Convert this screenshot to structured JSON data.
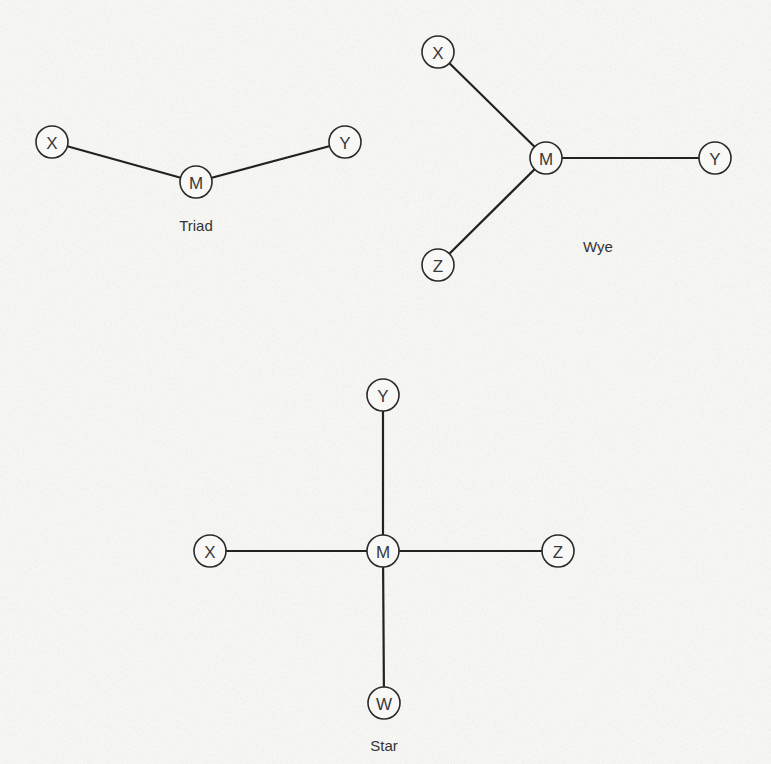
{
  "figure": {
    "node_radius": 16,
    "colors": {
      "background": "#f6f6f3",
      "stroke": "#222222",
      "text": "#333333"
    },
    "diagrams": [
      {
        "id": "triad",
        "caption": "Triad",
        "caption_pos": [
          196,
          225
        ],
        "nodes": [
          {
            "id": "X",
            "label": "X",
            "pos": [
              52,
              142
            ]
          },
          {
            "id": "M",
            "label": "M",
            "pos": [
              196,
              182
            ]
          },
          {
            "id": "Y",
            "label": "Y",
            "pos": [
              345,
              142
            ]
          }
        ],
        "edges": [
          [
            "X",
            "M"
          ],
          [
            "M",
            "Y"
          ]
        ]
      },
      {
        "id": "wye",
        "caption": "Wye",
        "caption_pos": [
          598,
          246
        ],
        "nodes": [
          {
            "id": "X",
            "label": "X",
            "pos": [
              438,
              52
            ]
          },
          {
            "id": "M",
            "label": "M",
            "pos": [
              546,
              158
            ]
          },
          {
            "id": "Y",
            "label": "Y",
            "pos": [
              715,
              158
            ]
          },
          {
            "id": "Z",
            "label": "Z",
            "pos": [
              438,
              265
            ]
          }
        ],
        "edges": [
          [
            "X",
            "M"
          ],
          [
            "M",
            "Y"
          ],
          [
            "M",
            "Z"
          ]
        ]
      },
      {
        "id": "star",
        "caption": "Star",
        "caption_pos": [
          384,
          745
        ],
        "nodes": [
          {
            "id": "Y",
            "label": "Y",
            "pos": [
              383,
              395
            ]
          },
          {
            "id": "X",
            "label": "X",
            "pos": [
              210,
              551
            ]
          },
          {
            "id": "M",
            "label": "M",
            "pos": [
              383,
              551
            ]
          },
          {
            "id": "Z",
            "label": "Z",
            "pos": [
              558,
              551
            ]
          },
          {
            "id": "W",
            "label": "W",
            "pos": [
              384,
              703
            ]
          }
        ],
        "edges": [
          [
            "Y",
            "M"
          ],
          [
            "X",
            "M"
          ],
          [
            "M",
            "Z"
          ],
          [
            "M",
            "W"
          ]
        ]
      }
    ]
  }
}
